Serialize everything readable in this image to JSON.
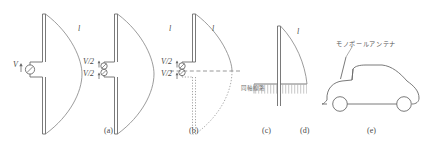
{
  "figure": {
    "line_color": "#6b6b6b",
    "text_color": "#4a4a4a",
    "background": "#ffffff"
  },
  "panels": [
    {
      "id": "a",
      "caption": "(a)",
      "caption_x": 104,
      "caption_y": 131,
      "type": "center-fed-dipole",
      "labels": [
        {
          "name": "current-distribution-label",
          "text": "l",
          "x": 78,
          "y": 28
        },
        {
          "name": "source-voltage-label",
          "text": "V",
          "x": 14,
          "y": 64
        }
      ]
    },
    {
      "id": "b",
      "caption": "(b)",
      "caption_x": 189,
      "caption_y": 131,
      "type": "split-source-dipole",
      "labels": [
        {
          "name": "current-distribution-label",
          "text": "l",
          "x": 169,
          "y": 28
        },
        {
          "name": "upper-source-label",
          "text": "V/2",
          "x": 86,
          "y": 60
        },
        {
          "name": "lower-source-label",
          "text": "V/2",
          "x": 86,
          "y": 73
        }
      ]
    },
    {
      "id": "c",
      "caption": "(c)",
      "caption_x": 262,
      "caption_y": 131,
      "type": "image-theory-dipole",
      "labels": [
        {
          "name": "current-distribution-label",
          "text": "l",
          "x": 212,
          "y": 28
        },
        {
          "name": "upper-source-label",
          "text": "V/2",
          "x": 150,
          "y": 60
        },
        {
          "name": "lower-source-label",
          "text": "V/2",
          "x": 150,
          "y": 73
        }
      ]
    },
    {
      "id": "d",
      "caption": "(d)",
      "caption_x": 300,
      "caption_y": 131,
      "type": "monopole-over-ground-plane",
      "labels": [
        {
          "name": "current-distribution-label",
          "text": "l",
          "x": 302,
          "y": 30
        },
        {
          "name": "coaxial-feed-label",
          "text": "同軸線路",
          "x": 242,
          "y": 84
        }
      ]
    },
    {
      "id": "e",
      "caption": "(e)",
      "caption_x": 367,
      "caption_y": 131,
      "type": "car-mounted-monopole",
      "labels": [
        {
          "name": "monopole-antenna-label",
          "text": "モノポールアンテナ",
          "x": 336,
          "y": 42
        }
      ]
    }
  ],
  "captions": {
    "a": "(a)",
    "b": "(b)",
    "c": "(c)",
    "d": "(d)",
    "e": "(e)"
  },
  "text": {
    "length_label": "l",
    "voltage_label": "V",
    "half_voltage_label": "V/2",
    "coaxial_line_jp": "同軸線路",
    "monopole_antenna_jp": "モノポールアンテナ"
  }
}
